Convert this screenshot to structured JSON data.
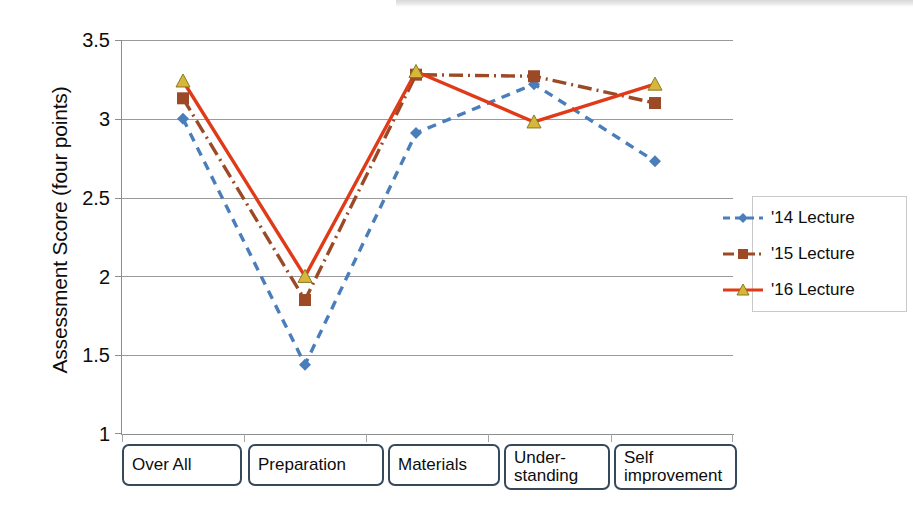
{
  "chart_data": {
    "type": "line",
    "title": "",
    "subtitle": "",
    "xlabel": "",
    "ylabel": "Assessment Score (four points)",
    "categories": [
      "Over All",
      "Preparation",
      "Materials",
      "Under-\nstanding",
      "Self\nimprovement"
    ],
    "ylim": [
      1,
      3.5
    ],
    "yticks": [
      "1",
      "1.5",
      "2",
      "2.5",
      "3",
      "3.5"
    ],
    "ytick_values": [
      1,
      1.5,
      2,
      2.5,
      3,
      3.5
    ],
    "grid": true,
    "legend_position": "right",
    "series": [
      {
        "name": "'14 Lecture",
        "values": [
          3.0,
          1.44,
          2.91,
          3.22,
          2.73
        ],
        "color": "#4a7ebb",
        "marker": "diamond",
        "marker_color": "#4a7ebb",
        "linestyle": "dashed"
      },
      {
        "name": "'15 Lecture",
        "values": [
          3.13,
          1.85,
          3.28,
          3.27,
          3.1
        ],
        "color": "#9c4a26",
        "marker": "square",
        "marker_color": "#9c4a26",
        "linestyle": "dashdot"
      },
      {
        "name": "'16 Lecture",
        "values": [
          3.24,
          2.0,
          3.3,
          2.98,
          3.22
        ],
        "color": "#e03a18",
        "marker": "triangle",
        "marker_color": "#d6b739",
        "linestyle": "solid"
      }
    ]
  },
  "axis": {
    "y_title": "Assessment Score (four points)",
    "y_tick_0": "1",
    "y_tick_1": "1.5",
    "y_tick_2": "2",
    "y_tick_3": "2.5",
    "y_tick_4": "3",
    "y_tick_5": "3.5"
  },
  "categories": {
    "c0": "Over All",
    "c1": "Preparation",
    "c2": "Materials",
    "c3": "Under-\nstanding",
    "c4": "Self\nimprovement"
  },
  "legend": {
    "item_0": "'14 Lecture",
    "item_1": "'15 Lecture",
    "item_2": "'16 Lecture"
  },
  "colors": {
    "series_14": "#4a7ebb",
    "series_15": "#9c4a26",
    "series_16": "#e03a18",
    "triangle_fill": "#d6b739",
    "gridline": "#9a9a9a",
    "axis": "#8d8d8d",
    "label_border": "#36495b"
  }
}
